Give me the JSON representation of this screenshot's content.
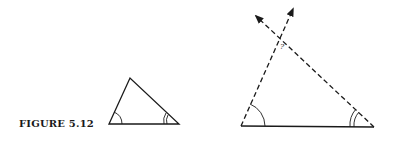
{
  "figure": {
    "caption": "FIGURE 5.12",
    "unknown_angle_label": "?",
    "line_color": "#1a1a1a"
  },
  "diagram": {
    "small_triangle": {
      "vertices": {
        "bottom_left": [
          109,
          124
        ],
        "apex": [
          130,
          78
        ],
        "bottom_right": [
          179,
          124
        ]
      },
      "angle_marks": {
        "bottom_left": "single-arc",
        "bottom_right": "double-arc"
      }
    },
    "large_triangle": {
      "base": {
        "from": [
          241,
          126
        ],
        "to": [
          374,
          127
        ],
        "style": "solid"
      },
      "left_side": {
        "from": [
          241,
          126
        ],
        "to": [
          293,
          8
        ],
        "style": "dashed",
        "arrow": true
      },
      "right_side": {
        "from": [
          374,
          127
        ],
        "to": [
          255,
          15
        ],
        "style": "dashed",
        "arrow": true
      },
      "intersection": [
        281,
        40
      ],
      "angle_marks": {
        "bottom_left": "single-arc",
        "bottom_right": "double-arc",
        "top": "?"
      }
    }
  }
}
